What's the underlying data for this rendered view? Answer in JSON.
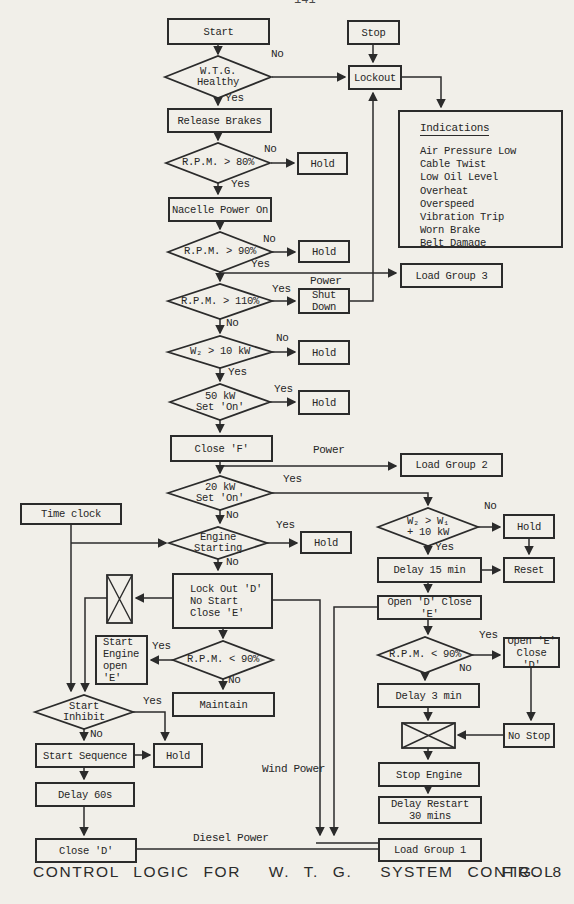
{
  "page": {
    "header_fragment": "141"
  },
  "caption": {
    "text": "CONTROL LOGIC FOR  W. T. G.  SYSTEM CONTROL",
    "fig": "FIG. 8"
  },
  "common": {
    "yes": "Yes",
    "no": "No",
    "hold": "Hold",
    "power": "Power"
  },
  "labels": {
    "wind_power": "Wind Power",
    "diesel_power": "Diesel Power"
  },
  "boxes": {
    "start": "Start",
    "stop": "Stop",
    "lockout": "Lockout",
    "release_brakes": "Release Brakes",
    "nacelle_power_on": "Nacelle Power On",
    "load_group_3": "Load Group 3",
    "shut_down": "Shut\nDown",
    "close_f": "Close 'F'",
    "load_group_2": "Load Group 2",
    "time_clock": "Time clock",
    "delay_15_min": "Delay 15 min",
    "reset": "Reset",
    "lock_out_d": "Lock Out 'D'\nNo Start\nClose 'E'",
    "open_d_close_e": "Open 'D' Close 'E'",
    "start_engine": "Start\nEngine\nopen 'E'",
    "open_e_close_d": "Open 'E'\nClose 'D'",
    "maintain": "Maintain",
    "delay_3_min": "Delay 3 min",
    "no_stop": "No Stop",
    "start_sequence": "Start Sequence",
    "delay_60s": "Delay 60s",
    "stop_engine": "Stop Engine",
    "delay_restart": "Delay Restart\n30 mins",
    "close_d": "Close 'D'",
    "load_group_1": "Load Group 1"
  },
  "diamonds": {
    "wtg_healthy": "W.T.G.\nHealthy",
    "rpm_gt_80": "R.P.M. > 80%",
    "rpm_gt_90": "R.P.M. > 90%",
    "rpm_gt_110": "R.P.M. > 110%",
    "w2_gt_10kw": "W₂ > 10 kW",
    "kw50_set_on": "50 kW\nSet 'On'",
    "kw20_set_on": "20 kW\nSet 'On'",
    "engine_starting": "Engine\nStarting",
    "w2_gt_w1": "W₂ > W₁\n+ 10 kW",
    "rpm_lt_90_left": "R.P.M. < 90%",
    "rpm_lt_90_right": "R.P.M. < 90%",
    "start_inhibit": "Start\nInhibit"
  },
  "indications": {
    "title": "Indications",
    "items": [
      "Air Pressure Low",
      "Cable Twist",
      "Low Oil Level",
      "Overheat",
      "Overspeed",
      "Vibration Trip",
      "Worn Brake",
      "Belt Damage"
    ]
  },
  "colors": {
    "ink": "#2b2b2b",
    "paper": "#f1efe9"
  }
}
